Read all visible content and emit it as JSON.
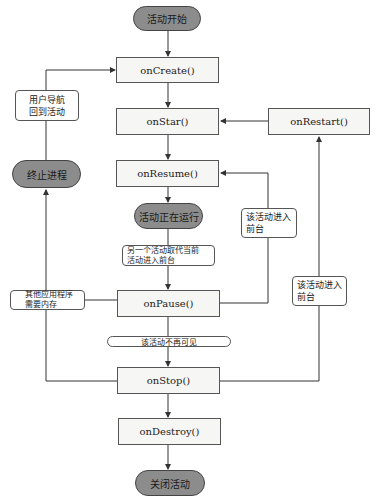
{
  "diagram": {
    "colors": {
      "terminal_fill": "#8c8c8c",
      "box_fill": "#f6f6f4",
      "line": "#333333"
    },
    "terminals": {
      "start": "活动开始",
      "running": "活动正在运行",
      "kill_process": "终止进程",
      "shutdown": "关闭活动"
    },
    "methods": {
      "on_create": "onCreate()",
      "on_start": "onStar()",
      "on_resume": "onResume()",
      "on_pause": "onPause()",
      "on_stop": "onStop()",
      "on_destroy": "onDestroy()",
      "on_restart": "onRestart()"
    },
    "notes": {
      "user_navigates_back": "用户导航\n回到活动",
      "other_activity_foreground": "另一个活动取代当前\n活动进入前台",
      "other_apps_need_memory": "其他应用程序\n需要内存",
      "activity_not_visible": "该活动不再可见",
      "to_foreground_resume": "该活动进入\n前台",
      "to_foreground_restart": "该活动进入\n前台"
    }
  }
}
